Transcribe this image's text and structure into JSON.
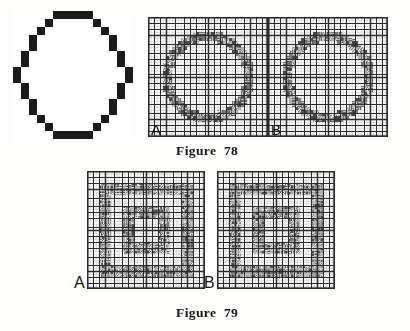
{
  "page": {
    "background_color": "#fdfdfb",
    "ink_color": "#1a1a1a",
    "kind": "scanned-book-page-weaving-drafts"
  },
  "circle_figure": {
    "name": "pixelated-circle-outline",
    "description": "Stepped blocky outline of a circle drawn on a coarse grid",
    "block_color": "#1c1c1c",
    "cell_size": 8,
    "grid_cols": 15,
    "grid_rows": 16,
    "radius_cells": 7.1,
    "center_col": 7,
    "center_row": 7.6,
    "ring_cells": [
      [
        5,
        0
      ],
      [
        6,
        0
      ],
      [
        7,
        0
      ],
      [
        8,
        0
      ],
      [
        9,
        0
      ],
      [
        4,
        1
      ],
      [
        10,
        1
      ],
      [
        3,
        2
      ],
      [
        11,
        2
      ],
      [
        2,
        3
      ],
      [
        12,
        3
      ],
      [
        2,
        4
      ],
      [
        12,
        4
      ],
      [
        1,
        5
      ],
      [
        13,
        5
      ],
      [
        1,
        6
      ],
      [
        13,
        6
      ],
      [
        0,
        7
      ],
      [
        14,
        7
      ],
      [
        0,
        8
      ],
      [
        14,
        8
      ],
      [
        1,
        9
      ],
      [
        13,
        9
      ],
      [
        1,
        10
      ],
      [
        13,
        10
      ],
      [
        2,
        11
      ],
      [
        12,
        11
      ],
      [
        2,
        12
      ],
      [
        12,
        12
      ],
      [
        3,
        13
      ],
      [
        11,
        13
      ],
      [
        4,
        14
      ],
      [
        10,
        14
      ],
      [
        5,
        15
      ],
      [
        6,
        15
      ],
      [
        7,
        15
      ],
      [
        8,
        15
      ],
      [
        9,
        15
      ]
    ]
  },
  "figure_78": {
    "caption": "Figure  78",
    "drafts": [
      {
        "label": "A",
        "name": "draft-78a",
        "motif": "octagon-circle",
        "cells": 40,
        "size_px": 120
      },
      {
        "label": "B",
        "name": "draft-78b",
        "motif": "octagon-circle",
        "cells": 40,
        "size_px": 120
      }
    ]
  },
  "figure_79": {
    "caption": "Figure  79",
    "drafts": [
      {
        "label": "A",
        "name": "draft-79a",
        "motif": "diamond-block-grid",
        "cells": 40,
        "size_px": 118
      },
      {
        "label": "B",
        "name": "draft-79b",
        "motif": "diamond-block-grid",
        "cells": 40,
        "size_px": 118
      }
    ]
  },
  "render": {
    "line_color": "#2b2b2b",
    "fill_dark": "#4a4a4a",
    "fill_mid": "#7d7d7d",
    "fill_light": "#b9b9b9"
  }
}
